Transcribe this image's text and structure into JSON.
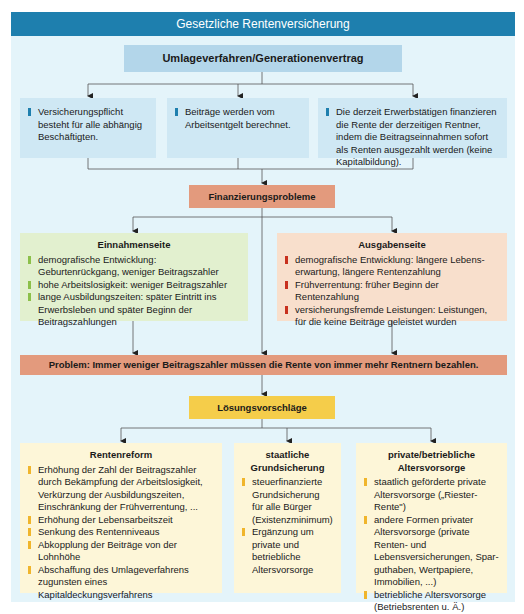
{
  "title": "Gesetzliche Rentenversicherung",
  "top_node": "Umlageverfahren/Generationenvertrag",
  "principles": [
    "Versicherungspflicht besteht für alle abhängig Beschäftigten.",
    "Beiträge werden vom Arbeitsentgelt berechnet.",
    "Die derzeit Erwerbstätigen finanzieren die Rente der derzeitigen Rentner, indem die Beitragseinnahmen sofort als Renten ausgezahlt werden (keine Kapitalbildung)."
  ],
  "financing_problems": "Finanzierungsprobleme",
  "income_side": {
    "title": "Einnahmenseite",
    "items": [
      "demografische Entwicklung: Geburtenrückgang, weniger Beitragszahler",
      "hohe Arbeitslosigkeit: weniger Beitragszahler",
      "lange Ausbildungszeiten: später Eintritt ins Erwerbs­leben und später Beginn der Beitragszahlungen"
    ]
  },
  "expense_side": {
    "title": "Ausgabenseite",
    "items": [
      "demografische Entwicklung: längere Lebens­erwartung, längere Rentenzahlung",
      "Frühverrentung: früher Beginn der Rentenzahlung",
      "versicherungsfremde Leistungen: Leistungen, für die keine Beiträge geleistet wurden"
    ]
  },
  "problem": "Problem: Immer weniger Beitragszahler müssen die Rente von immer mehr Rentnern bezahlen.",
  "solutions_title": "Lösungsvorschläge",
  "solutions": [
    {
      "title": "Rentenreform",
      "items": [
        "Erhöhung der Zahl der Beitragszahler durch Bekämpfung der Arbeitslosigkeit, Verkürzung der Ausbildungszeiten, Einschränkung der Frühverrentung, ...",
        "Erhöhung der Lebensarbeitszeit",
        "Senkung des Rentenniveaus",
        "Abkopplung der Beiträge von der Lohnhöhe",
        "Abschaffung des Umlageverfahrens zugunsten eines Kapitaldeckungsverfahrens"
      ]
    },
    {
      "title": "staatliche Grundsicherung",
      "items": [
        "steuerfinanzierte Grundsicherung für alle Bürger (Existenzminimum)",
        "Ergänzung um private und betrieb­liche Altersvorsorge"
      ]
    },
    {
      "title": "private/betriebliche Altersvorsorge",
      "items": [
        "staatlich geförderte private Altersvorsorge („Riester-Rente\")",
        "andere Formen privater Alters­vorsorge (private Renten- und Lebensversicherungen, Spar­guthaben, Wertpapiere, Immobilien, ...)",
        "betriebliche Altersvorsorge (Betriebsrenten u. Ä.)"
      ]
    }
  ],
  "colors": {
    "title_bar": "#1e7fae",
    "background": "#e4f4fa",
    "blue_head": "#b3d6ea",
    "blue_box": "#cfe8f4",
    "salmon": "#e39a7d",
    "green_box": "#e2f0cf",
    "peach_box": "#f8dfcc",
    "yellow_head": "#f5cd4a",
    "cream_box": "#fdf6d8"
  }
}
